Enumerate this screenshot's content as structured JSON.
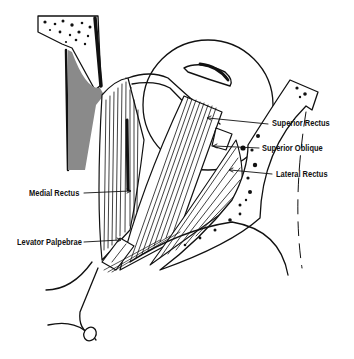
{
  "figure": {
    "labels": {
      "superior_rectus": "Superior Rectus",
      "superior_oblique": "Superior Oblique",
      "lateral_rectus": "Lateral Rectus",
      "medial_rectus": "Medial Rectus",
      "levator_palpebrae": "Levator Palpebrae"
    },
    "colors": {
      "ink": "#111111",
      "background": "#ffffff",
      "bone_shade": "#7a7a7a"
    }
  }
}
